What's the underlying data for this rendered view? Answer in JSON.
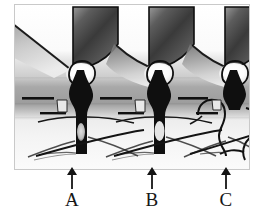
{
  "figure": {
    "kind": "grayscale-dental-illustration",
    "title": "",
    "caption": "",
    "background_color": "#ffffff",
    "plate": {
      "x": 14,
      "y": 4,
      "width": 236,
      "height": 166,
      "base_color": "#f2f2f2",
      "ink_color": "#141414"
    },
    "palette": {
      "ink": "#141414",
      "crown_dark": "#2a2a2a",
      "crown_mid": "#6f6f6f",
      "crown_light": "#d9d9d9",
      "tissue_light": "#e9e9e9",
      "tissue_mid": "#b4b4b4",
      "tissue_dark": "#8a8a8a",
      "bone_light": "#efefef",
      "interdental_fill": "#101010",
      "pocket_outline": "#111111",
      "highlight": "#fbfbfb"
    },
    "bands": [
      {
        "name": "crown-band",
        "y": 0,
        "height": 58,
        "shade": "#ededed"
      },
      {
        "name": "gingiva-band",
        "y": 58,
        "height": 22,
        "shade": "#cfcfcf"
      },
      {
        "name": "tissue-band",
        "y": 80,
        "height": 26,
        "shade": "#9a9a9a"
      },
      {
        "name": "crest-band",
        "y": 106,
        "height": 14,
        "shade": "#d2d2d2"
      },
      {
        "name": "bone-band",
        "y": 120,
        "height": 46,
        "shade": "#f0f0f0"
      }
    ],
    "units": [
      {
        "id": "unit-a",
        "label": "A",
        "center_x": 72,
        "interdental_style": "filled-dark",
        "has_pocket_outline": false,
        "has_radiolucency": true
      },
      {
        "id": "unit-b",
        "label": "B",
        "center_x": 152,
        "interdental_style": "filled-dark",
        "has_pocket_outline": false,
        "has_radiolucency": true
      },
      {
        "id": "unit-c",
        "label": "C",
        "center_x": 226,
        "interdental_style": "outlined-open",
        "has_pocket_outline": true,
        "has_radiolucency": false
      }
    ],
    "callouts": [
      {
        "id": "callout-a",
        "label": "A",
        "arrow": "arrow-up",
        "target": "unit-a",
        "x": 59,
        "y": 166
      },
      {
        "id": "callout-b",
        "label": "B",
        "arrow": "arrow-up",
        "target": "unit-b",
        "x": 139,
        "y": 166
      },
      {
        "id": "callout-c",
        "label": "C",
        "arrow": "arrow-up",
        "target": "unit-c",
        "x": 213,
        "y": 166
      }
    ]
  }
}
